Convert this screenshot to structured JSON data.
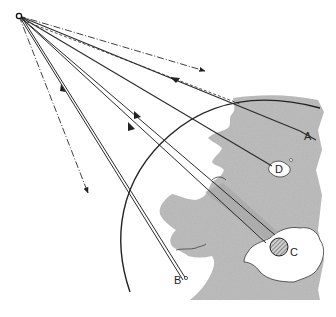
{
  "diagram": {
    "colors": {
      "land": "#b9b9b9",
      "line": "#2a2a2a",
      "water": "#ffffff",
      "hatched_target": "#8a8a8a"
    },
    "labels": {
      "A": "A",
      "B": "B",
      "C": "C",
      "D": "D"
    }
  }
}
